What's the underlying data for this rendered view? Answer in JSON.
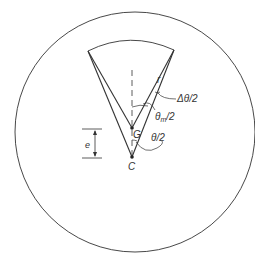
{
  "diagram": {
    "type": "geometry",
    "labels": {
      "r": "r",
      "delta_theta_half": "Δθ/2",
      "theta_m_half_main": "θ",
      "theta_m_sub": "m",
      "theta_m_tail": "/2",
      "theta_half": "θ/2",
      "G": "G",
      "C": "C",
      "e": "e"
    },
    "colors": {
      "stroke": "#333333",
      "background": "#ffffff"
    }
  }
}
